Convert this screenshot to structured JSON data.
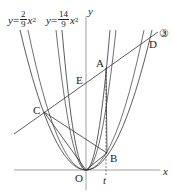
{
  "labels": {
    "y_axis": "y",
    "x_axis": "x",
    "origin": "O",
    "t": "t",
    "A": "A",
    "B": "B",
    "C": "C",
    "D": "D",
    "E": "E",
    "line3": "③"
  },
  "equations": [
    {
      "lhs": "y",
      "eq": "=",
      "num": "2",
      "den": "9",
      "var": "x",
      "exp": "2"
    },
    {
      "lhs": "y",
      "eq": "=",
      "num": "14",
      "den": "9",
      "var": "x",
      "exp": "2"
    }
  ]
}
